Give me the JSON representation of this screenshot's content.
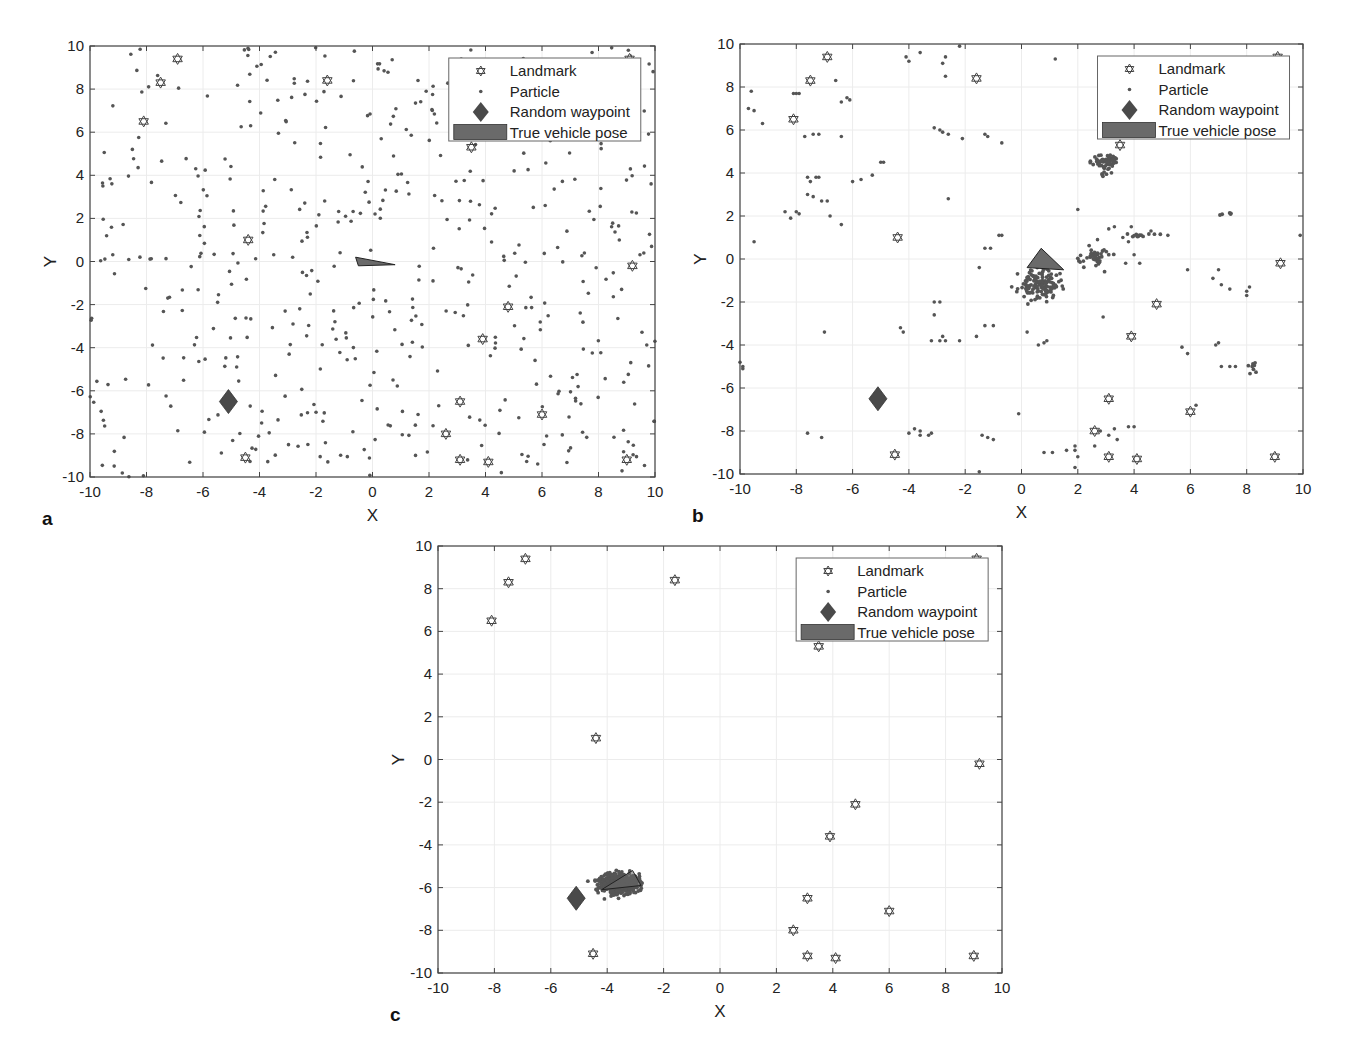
{
  "figure": {
    "colors": {
      "particle": "#555555",
      "waypoint": "#4a4a4a",
      "vehicle": "#6a6a6a",
      "landmark_stroke": "#444444",
      "axis": "#444444",
      "grid": "#ececec"
    },
    "legend": {
      "items": [
        {
          "label": "Landmark",
          "marker": "hexagram-icon"
        },
        {
          "label": "Particle",
          "marker": "dot-icon"
        },
        {
          "label": "Random waypoint",
          "marker": "diamond-icon"
        },
        {
          "label": "True vehicle pose",
          "marker": "filled-rect-icon"
        }
      ]
    }
  },
  "chart_data": [
    {
      "id": "a",
      "panel_label": "a",
      "type": "scatter",
      "title": "",
      "xlabel": "X",
      "ylabel": "Y",
      "xlim": [
        -10,
        10
      ],
      "ylim": [
        -10,
        10
      ],
      "xticks": [
        -10,
        -8,
        -6,
        -4,
        -2,
        0,
        2,
        4,
        6,
        8,
        10
      ],
      "yticks": [
        -10,
        -8,
        -6,
        -4,
        -2,
        0,
        2,
        4,
        6,
        8,
        10
      ],
      "grid": true,
      "legend_position": "northeast",
      "pixel_box": {
        "left": 90,
        "top": 46,
        "right": 655,
        "bottom": 477
      },
      "series": [
        {
          "name": "Landmark",
          "type": "hexagram",
          "points": [
            [
              -6.9,
              9.4
            ],
            [
              -7.5,
              8.3
            ],
            [
              -8.1,
              6.5
            ],
            [
              -1.6,
              8.4
            ],
            [
              3.5,
              5.3
            ],
            [
              9.1,
              9.4
            ],
            [
              -4.4,
              1.0
            ],
            [
              9.2,
              -0.2
            ],
            [
              4.8,
              -2.1
            ],
            [
              3.9,
              -3.6
            ],
            [
              3.1,
              -6.5
            ],
            [
              6.0,
              -7.1
            ],
            [
              2.6,
              -8.0
            ],
            [
              3.1,
              -9.2
            ],
            [
              4.1,
              -9.3
            ],
            [
              9.0,
              -9.2
            ],
            [
              -4.5,
              -9.1
            ]
          ]
        },
        {
          "name": "Random waypoint",
          "type": "diamond",
          "points": [
            [
              -5.1,
              -6.5
            ]
          ]
        },
        {
          "name": "True vehicle pose",
          "type": "triangle",
          "points": [
            [
              -0.6,
              0.2
            ],
            [
              0.8,
              -0.15
            ],
            [
              -0.5,
              -0.2
            ]
          ]
        },
        {
          "name": "Particle",
          "type": "uniform-random",
          "count": 520,
          "seed": 11,
          "xrange": [
            -10,
            10
          ],
          "yrange": [
            -10,
            10
          ]
        }
      ]
    },
    {
      "id": "b",
      "panel_label": "b",
      "type": "scatter",
      "title": "",
      "xlabel": "X",
      "ylabel": "Y",
      "xlim": [
        -10,
        10
      ],
      "ylim": [
        -10,
        10
      ],
      "xticks": [
        -10,
        -8,
        -6,
        -4,
        -2,
        0,
        2,
        4,
        6,
        8,
        10
      ],
      "yticks": [
        -10,
        -8,
        -6,
        -4,
        -2,
        0,
        2,
        4,
        6,
        8,
        10
      ],
      "grid": true,
      "legend_position": "northeast",
      "pixel_box": {
        "left": 740,
        "top": 44,
        "right": 1303,
        "bottom": 474
      },
      "series": [
        {
          "name": "Landmark",
          "type": "hexagram",
          "points": [
            [
              -6.9,
              9.4
            ],
            [
              -7.5,
              8.3
            ],
            [
              -8.1,
              6.5
            ],
            [
              -1.6,
              8.4
            ],
            [
              3.5,
              5.3
            ],
            [
              9.1,
              9.4
            ],
            [
              -4.4,
              1.0
            ],
            [
              9.2,
              -0.2
            ],
            [
              4.8,
              -2.1
            ],
            [
              3.9,
              -3.6
            ],
            [
              3.1,
              -6.5
            ],
            [
              6.0,
              -7.1
            ],
            [
              2.6,
              -8.0
            ],
            [
              3.1,
              -9.2
            ],
            [
              4.1,
              -9.3
            ],
            [
              9.0,
              -9.2
            ],
            [
              -4.5,
              -9.1
            ]
          ]
        },
        {
          "name": "Random waypoint",
          "type": "diamond",
          "points": [
            [
              -5.1,
              -6.5
            ]
          ]
        },
        {
          "name": "True vehicle pose",
          "type": "triangle",
          "points": [
            [
              0.2,
              -0.4
            ],
            [
              0.7,
              0.5
            ],
            [
              1.5,
              -0.5
            ]
          ]
        },
        {
          "name": "Particle",
          "type": "clusters",
          "seed": 23,
          "clusters": [
            {
              "cx": 0.6,
              "cy": -1.2,
              "sx": 0.35,
              "sy": 0.35,
              "n": 140
            },
            {
              "cx": 3.0,
              "cy": 4.5,
              "sx": 0.22,
              "sy": 0.22,
              "n": 70
            },
            {
              "cx": 2.6,
              "cy": 0.1,
              "sx": 0.3,
              "sy": 0.25,
              "n": 40
            },
            {
              "cx": 4.2,
              "cy": 1.1,
              "sx": 0.3,
              "sy": 0.05,
              "n": 12
            },
            {
              "cx": 8.2,
              "cy": -5.1,
              "sx": 0.08,
              "sy": 0.2,
              "n": 8
            },
            {
              "cx": 7.3,
              "cy": 2.1,
              "sx": 0.2,
              "sy": 0.05,
              "n": 5
            }
          ],
          "scattered": [
            [
              -9.5,
              0.8
            ],
            [
              -9.6,
              7.8
            ],
            [
              -9.7,
              7.0
            ],
            [
              -9.5,
              6.9
            ],
            [
              -9.2,
              6.3
            ],
            [
              -8.1,
              7.7
            ],
            [
              -8.0,
              7.7
            ],
            [
              -7.9,
              7.7
            ],
            [
              -7.7,
              5.7
            ],
            [
              -7.4,
              5.8
            ],
            [
              -7.2,
              5.8
            ],
            [
              -6.6,
              8.3
            ],
            [
              -6.4,
              7.3
            ],
            [
              -6.2,
              7.5
            ],
            [
              -6.1,
              7.4
            ],
            [
              -6.4,
              5.7
            ],
            [
              -8.4,
              2.2
            ],
            [
              -8.2,
              1.9
            ],
            [
              -8.0,
              2.2
            ],
            [
              -7.9,
              2.1
            ],
            [
              -7.6,
              3.8
            ],
            [
              -7.5,
              3.6
            ],
            [
              -7.3,
              3.8
            ],
            [
              -7.2,
              3.8
            ],
            [
              -7.6,
              3.0
            ],
            [
              -7.4,
              2.9
            ],
            [
              -7.1,
              2.7
            ],
            [
              -6.9,
              2.7
            ],
            [
              -6.8,
              2.0
            ],
            [
              -6.4,
              1.6
            ],
            [
              -6.0,
              3.6
            ],
            [
              -5.7,
              3.7
            ],
            [
              -5.3,
              3.9
            ],
            [
              -5.0,
              4.5
            ],
            [
              -4.9,
              4.5
            ],
            [
              -4.1,
              9.4
            ],
            [
              -4.0,
              9.2
            ],
            [
              -3.6,
              9.6
            ],
            [
              -2.8,
              9.1
            ],
            [
              -2.7,
              9.4
            ],
            [
              -2.7,
              8.5
            ],
            [
              -2.2,
              9.9
            ],
            [
              -3.1,
              6.1
            ],
            [
              -2.9,
              6.0
            ],
            [
              -2.8,
              5.9
            ],
            [
              -2.6,
              5.8
            ],
            [
              -2.1,
              5.6
            ],
            [
              -1.3,
              5.8
            ],
            [
              -1.2,
              5.7
            ],
            [
              -0.7,
              5.4
            ],
            [
              -2.6,
              2.8
            ],
            [
              -1.3,
              0.5
            ],
            [
              -1.1,
              0.5
            ],
            [
              -0.8,
              1.1
            ],
            [
              -0.7,
              1.1
            ],
            [
              -1.5,
              -0.4
            ],
            [
              -10.0,
              -4.8
            ],
            [
              -9.9,
              -5.0
            ],
            [
              -9.9,
              -5.1
            ],
            [
              -7.0,
              -3.4
            ],
            [
              -4.3,
              -3.2
            ],
            [
              -4.2,
              -3.4
            ],
            [
              -3.1,
              -2.0
            ],
            [
              -2.9,
              -2.0
            ],
            [
              -3.1,
              -2.6
            ],
            [
              -3.2,
              -3.8
            ],
            [
              -2.9,
              -3.8
            ],
            [
              -2.8,
              -3.6
            ],
            [
              -2.7,
              -3.8
            ],
            [
              -2.2,
              -3.8
            ],
            [
              -1.6,
              -3.6
            ],
            [
              -1.3,
              -3.1
            ],
            [
              -1.0,
              -3.1
            ],
            [
              -0.1,
              -7.2
            ],
            [
              -7.6,
              -8.1
            ],
            [
              -7.1,
              -8.3
            ],
            [
              -4.0,
              -8.1
            ],
            [
              -3.8,
              -7.9
            ],
            [
              -3.6,
              -8.0
            ],
            [
              -3.6,
              -8.2
            ],
            [
              -3.3,
              -8.2
            ],
            [
              -3.2,
              -8.1
            ],
            [
              -1.4,
              -8.2
            ],
            [
              -1.2,
              -8.3
            ],
            [
              -1.0,
              -8.4
            ],
            [
              -1.5,
              -9.9
            ],
            [
              0.2,
              -3.4
            ],
            [
              0.6,
              -4.0
            ],
            [
              0.8,
              -3.9
            ],
            [
              0.9,
              -3.8
            ],
            [
              2.9,
              -2.7
            ],
            [
              0.8,
              -9.0
            ],
            [
              1.1,
              -9.0
            ],
            [
              1.6,
              -8.9
            ],
            [
              1.9,
              -8.7
            ],
            [
              1.9,
              -8.9
            ],
            [
              2.0,
              -9.2
            ],
            [
              1.9,
              -9.7
            ],
            [
              2.6,
              -8.7
            ],
            [
              2.8,
              -8.0
            ],
            [
              3.1,
              -8.2
            ],
            [
              3.3,
              -7.9
            ],
            [
              3.4,
              -8.4
            ],
            [
              3.8,
              -7.8
            ],
            [
              4.0,
              -7.8
            ],
            [
              5.7,
              -4.1
            ],
            [
              5.9,
              -4.4
            ],
            [
              6.9,
              -4.0
            ],
            [
              7.0,
              -3.9
            ],
            [
              7.1,
              -5.0
            ],
            [
              7.4,
              -5.0
            ],
            [
              7.6,
              -5.0
            ],
            [
              6.2,
              -6.8
            ],
            [
              5.9,
              -0.5
            ],
            [
              6.8,
              -0.9
            ],
            [
              7.0,
              -0.5
            ],
            [
              7.1,
              -1.2
            ],
            [
              7.4,
              -1.4
            ],
            [
              8.0,
              -1.5
            ],
            [
              8.1,
              -1.3
            ],
            [
              8.0,
              -1.7
            ],
            [
              9.9,
              1.1
            ],
            [
              2.0,
              2.3
            ],
            [
              2.7,
              0.9
            ],
            [
              3.1,
              1.4
            ],
            [
              3.8,
              0.8
            ],
            [
              3.9,
              1.5
            ],
            [
              4.6,
              1.3
            ],
            [
              5.2,
              1.1
            ],
            [
              3.6,
              1.0
            ],
            [
              4.0,
              0.2
            ],
            [
              4.2,
              -0.2
            ],
            [
              3.3,
              1.5
            ],
            [
              2.2,
              -0.1
            ],
            [
              3.7,
              -0.2
            ],
            [
              5.8,
              8.6
            ],
            [
              5.6,
              5.8
            ],
            [
              1.2,
              9.3
            ]
          ]
        }
      ]
    },
    {
      "id": "c",
      "panel_label": "c",
      "type": "scatter",
      "title": "",
      "xlabel": "X",
      "ylabel": "Y",
      "xlim": [
        -10,
        10
      ],
      "ylim": [
        -10,
        10
      ],
      "xticks": [
        -10,
        -8,
        -6,
        -4,
        -2,
        0,
        2,
        4,
        6,
        8,
        10
      ],
      "yticks": [
        -10,
        -8,
        -6,
        -4,
        -2,
        0,
        2,
        4,
        6,
        8,
        10
      ],
      "grid": true,
      "legend_position": "northeast",
      "pixel_box": {
        "left": 438,
        "top": 546,
        "right": 1002,
        "bottom": 973
      },
      "series": [
        {
          "name": "Landmark",
          "type": "hexagram",
          "points": [
            [
              -6.9,
              9.4
            ],
            [
              -7.5,
              8.3
            ],
            [
              -8.1,
              6.5
            ],
            [
              -1.6,
              8.4
            ],
            [
              3.5,
              5.3
            ],
            [
              9.1,
              9.4
            ],
            [
              -4.4,
              1.0
            ],
            [
              9.2,
              -0.2
            ],
            [
              4.8,
              -2.1
            ],
            [
              3.9,
              -3.6
            ],
            [
              3.1,
              -6.5
            ],
            [
              6.0,
              -7.1
            ],
            [
              2.6,
              -8.0
            ],
            [
              3.1,
              -9.2
            ],
            [
              4.1,
              -9.3
            ],
            [
              9.0,
              -9.2
            ],
            [
              -4.5,
              -9.1
            ]
          ]
        },
        {
          "name": "Random waypoint",
          "type": "diamond",
          "points": [
            [
              -5.1,
              -6.5
            ]
          ]
        },
        {
          "name": "True vehicle pose",
          "type": "triangle",
          "points": [
            [
              -4.2,
              -6.1
            ],
            [
              -3.1,
              -5.2
            ],
            [
              -2.8,
              -5.9
            ]
          ]
        },
        {
          "name": "Particle",
          "type": "clusters",
          "seed": 37,
          "clusters": [
            {
              "cx": -3.6,
              "cy": -5.8,
              "sx": 0.35,
              "sy": 0.25,
              "n": 420
            }
          ],
          "scattered": []
        }
      ]
    }
  ]
}
